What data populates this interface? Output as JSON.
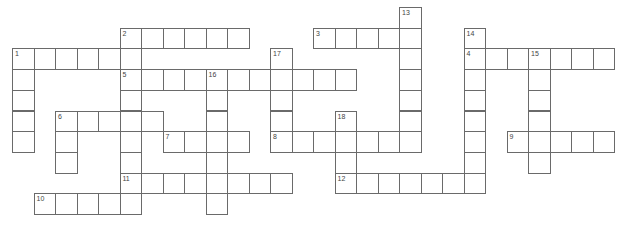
{
  "puzzle": {
    "type": "crossword",
    "layout": {
      "origin_x": 12,
      "origin_y": 7,
      "cell_w": 21.5,
      "cell_h": 20.7,
      "line_color": "#6a6a6a"
    },
    "entries": [
      {
        "number": "1",
        "direction": "across",
        "row": 2,
        "col": 0,
        "length": 6
      },
      {
        "number": "1",
        "direction": "down",
        "row": 2,
        "col": 0,
        "length": 5
      },
      {
        "number": "2",
        "direction": "across",
        "row": 1,
        "col": 5,
        "length": 6
      },
      {
        "number": "2",
        "direction": "down",
        "row": 1,
        "col": 5,
        "length": 9
      },
      {
        "number": "3",
        "direction": "across",
        "row": 1,
        "col": 14,
        "length": 5
      },
      {
        "number": "4",
        "direction": "across",
        "row": 2,
        "col": 21,
        "length": 7
      },
      {
        "number": "5",
        "direction": "across",
        "row": 3,
        "col": 5,
        "length": 11
      },
      {
        "number": "6",
        "direction": "across",
        "row": 5,
        "col": 2,
        "length": 5
      },
      {
        "number": "6",
        "direction": "down",
        "row": 5,
        "col": 2,
        "length": 3
      },
      {
        "number": "7",
        "direction": "across",
        "row": 6,
        "col": 7,
        "length": 4
      },
      {
        "number": "8",
        "direction": "across",
        "row": 6,
        "col": 12,
        "length": 7
      },
      {
        "number": "9",
        "direction": "across",
        "row": 6,
        "col": 23,
        "length": 5
      },
      {
        "number": "10",
        "direction": "across",
        "row": 9,
        "col": 1,
        "length": 5
      },
      {
        "number": "11",
        "direction": "across",
        "row": 8,
        "col": 5,
        "length": 8
      },
      {
        "number": "12",
        "direction": "across",
        "row": 8,
        "col": 15,
        "length": 7
      },
      {
        "number": "13",
        "direction": "down",
        "row": 0,
        "col": 18,
        "length": 7
      },
      {
        "number": "14",
        "direction": "down",
        "row": 1,
        "col": 21,
        "length": 8
      },
      {
        "number": "15",
        "direction": "down",
        "row": 2,
        "col": 24,
        "length": 6
      },
      {
        "number": "16",
        "direction": "down",
        "row": 3,
        "col": 9,
        "length": 7
      },
      {
        "number": "17",
        "direction": "down",
        "row": 2,
        "col": 12,
        "length": 5
      },
      {
        "number": "18",
        "direction": "down",
        "row": 5,
        "col": 15,
        "length": 4
      }
    ]
  }
}
